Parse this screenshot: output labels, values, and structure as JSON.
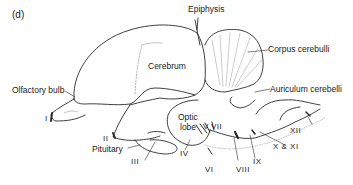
{
  "panel_label": "(d)",
  "labels": {
    "epiphysis": "Epiphysis",
    "corpus_cerebelli": "Corpus cerebulli",
    "cerebrum": "Cerebrum",
    "auriculum_cerebelli": "Auriculum cerebelli",
    "olfactory_bulb": "Olfactory bulb",
    "optic_lobe_1": "Optic",
    "optic_lobe_2": "lobe",
    "pituitary": "Pituitary"
  },
  "cranial_nerves": {
    "I": "I",
    "II": "II",
    "III": "III",
    "IV": "IV",
    "V": "V",
    "VI": "VI",
    "VII": "VII",
    "VIII": "VIII",
    "IX": "IX",
    "X_XI": "X & XI",
    "XII": "XII"
  },
  "colors": {
    "line": "#2a2a2a",
    "shade": "#9a9a9a",
    "text": "#1a1a1a"
  }
}
